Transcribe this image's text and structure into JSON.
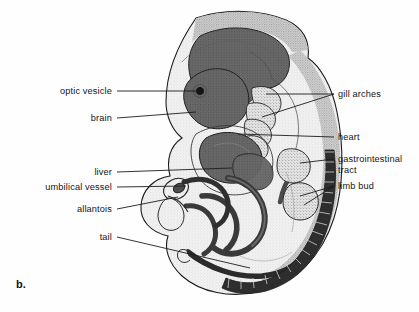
{
  "figure": {
    "panel_letter": "b.",
    "background_color": "#fefefe",
    "ink_color": "#1c1c1c"
  },
  "palette": {
    "outline": "#1c1c1c",
    "body_light": "#e8e8e8",
    "body_stipple": "#c9c9c9",
    "organ_dark": "#5a5a5a",
    "organ_mid": "#8a8a8a",
    "somite_dark": "#2e2e2e",
    "white": "#ffffff"
  },
  "labels_left": [
    {
      "id": "optic-vesicle",
      "text": "optic vesicle",
      "text_x": 112,
      "text_y": 94,
      "leader": "M117,91 L200,91"
    },
    {
      "id": "brain",
      "text": "brain",
      "text_x": 112,
      "text_y": 121,
      "leader": "M117,118 L196,112"
    },
    {
      "id": "liver",
      "text": "liver",
      "text_x": 112,
      "text_y": 175,
      "leader": "M117,172 L232,168"
    },
    {
      "id": "umbilical-vessel",
      "text": "umbilical vessel",
      "text_x": 112,
      "text_y": 190,
      "leader": "M117,187 L186,186"
    },
    {
      "id": "allantois",
      "text": "allantois",
      "text_x": 112,
      "text_y": 212,
      "leader": "M117,209 L178,197"
    },
    {
      "id": "tail",
      "text": "tail",
      "text_x": 112,
      "text_y": 240,
      "leader": "M117,237 L250,268"
    }
  ],
  "labels_right": [
    {
      "id": "gill-arches",
      "text": "gill arches",
      "text_x": 338,
      "text_y": 97,
      "leader": "M334,94 L266,94",
      "leader2": "M334,94 L262,117"
    },
    {
      "id": "heart",
      "text": "heart",
      "text_x": 338,
      "text_y": 140,
      "leader": "M334,137 L238,134"
    },
    {
      "id": "gastrointestinal-tract",
      "text": "gastrointestinal",
      "text2": "tract",
      "text_x": 338,
      "text_y": 162,
      "text2_y": 173,
      "leader": "M334,159 L300,163"
    },
    {
      "id": "limb-bud",
      "text": "limb bud",
      "text_x": 338,
      "text_y": 189,
      "leader": "M334,186 L300,196"
    }
  ]
}
